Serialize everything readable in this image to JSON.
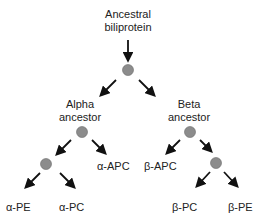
{
  "diagram": {
    "type": "phylogenetic-tree",
    "colors": {
      "node_fill": "#8c8c8c",
      "node_stroke": "#6a6a6a",
      "arrow": "#111111",
      "text": "#222222"
    },
    "root": {
      "label_line1": "Ancestral",
      "label_line2": "biliprotein"
    },
    "alpha": {
      "label_line1": "Alpha",
      "label_line2": "ancestor"
    },
    "beta": {
      "label_line1": "Beta",
      "label_line2": "ancestor"
    },
    "leaves": {
      "alpha_apc": "α-APC",
      "alpha_pe": "α-PE",
      "alpha_pc": "α-PC",
      "beta_apc": "β-APC",
      "beta_pc": "β-PC",
      "beta_pe": "β-PE"
    }
  }
}
